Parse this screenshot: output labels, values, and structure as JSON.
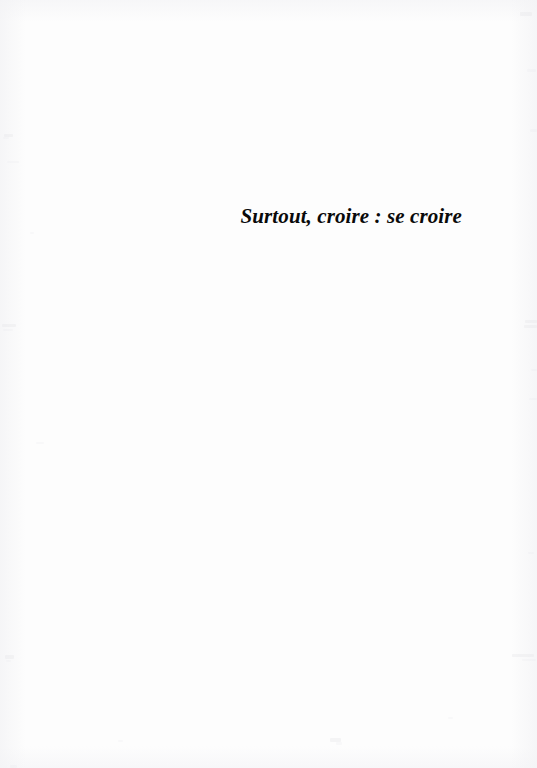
{
  "page": {
    "kind": "scanned-book-page",
    "width": 537,
    "height": 768,
    "paper_color": "#fdfdfd",
    "ink_color": "#0a0a0a",
    "edge_tint_color": "#f3f3f5",
    "speckle_color": "#d9d9dd"
  },
  "content": {
    "title": "Surtout, croire : se croire",
    "alignment": "right",
    "style": "bold-italic-serif"
  },
  "artifacts": {
    "label": "scan-speckles",
    "specks": [
      {
        "x": 4,
        "y": 134,
        "w": 9,
        "h": 3,
        "class": "soft"
      },
      {
        "x": 3,
        "y": 137,
        "w": 6,
        "h": 2,
        "class": "fainter"
      },
      {
        "x": 7,
        "y": 161,
        "w": 12,
        "h": 2,
        "class": "fainter"
      },
      {
        "x": 30,
        "y": 232,
        "w": 4,
        "h": 2,
        "class": "fainter"
      },
      {
        "x": 2,
        "y": 324,
        "w": 14,
        "h": 3,
        "class": "soft"
      },
      {
        "x": 3,
        "y": 329,
        "w": 10,
        "h": 2,
        "class": "fainter"
      },
      {
        "x": 36,
        "y": 442,
        "w": 8,
        "h": 2,
        "class": "fainter"
      },
      {
        "x": 5,
        "y": 655,
        "w": 9,
        "h": 4,
        "class": "soft"
      },
      {
        "x": 6,
        "y": 660,
        "w": 5,
        "h": 2,
        "class": "fainter"
      },
      {
        "x": 520,
        "y": 12,
        "w": 12,
        "h": 4,
        "class": "soft"
      },
      {
        "x": 527,
        "y": 69,
        "w": 9,
        "h": 3,
        "class": "fainter"
      },
      {
        "x": 530,
        "y": 129,
        "w": 7,
        "h": 3,
        "class": "fainter"
      },
      {
        "x": 525,
        "y": 320,
        "w": 12,
        "h": 3,
        "class": "soft"
      },
      {
        "x": 524,
        "y": 325,
        "w": 13,
        "h": 3,
        "class": "soft"
      },
      {
        "x": 531,
        "y": 369,
        "w": 6,
        "h": 2,
        "class": "fainter"
      },
      {
        "x": 529,
        "y": 398,
        "w": 8,
        "h": 2,
        "class": "fainter"
      },
      {
        "x": 528,
        "y": 552,
        "w": 6,
        "h": 2,
        "class": "fainter"
      },
      {
        "x": 512,
        "y": 654,
        "w": 22,
        "h": 3,
        "class": "soft"
      },
      {
        "x": 522,
        "y": 659,
        "w": 14,
        "h": 2,
        "class": "fainter"
      },
      {
        "x": 118,
        "y": 740,
        "w": 5,
        "h": 2,
        "class": "fainter"
      },
      {
        "x": 330,
        "y": 738,
        "w": 11,
        "h": 4,
        "class": "soft"
      },
      {
        "x": 336,
        "y": 742,
        "w": 6,
        "h": 3,
        "class": "fainter"
      },
      {
        "x": 448,
        "y": 717,
        "w": 5,
        "h": 2,
        "class": "fainter"
      },
      {
        "x": 10,
        "y": 765,
        "w": 7,
        "h": 3,
        "class": "fainter"
      }
    ]
  }
}
